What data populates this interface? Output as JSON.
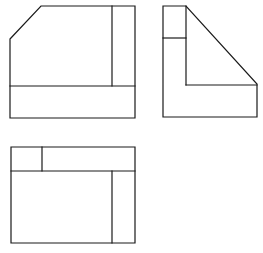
{
  "drawing": {
    "type": "orthographic-projection",
    "stroke_color": "#1a1a1a",
    "background": "#ffffff",
    "views": [
      {
        "name": "front-view",
        "outline": [
          [
            10,
            39
          ],
          [
            41,
            6
          ],
          [
            135,
            6
          ],
          [
            135,
            118
          ],
          [
            10,
            118
          ]
        ],
        "lines": [
          [
            [
              112,
              6
            ],
            [
              112,
              86
            ]
          ],
          [
            [
              10,
              86
            ],
            [
              135,
              86
            ]
          ]
        ]
      },
      {
        "name": "side-view",
        "outline": [
          [
            163,
            6
          ],
          [
            186,
            6
          ],
          [
            257,
            84
          ],
          [
            257,
            117
          ],
          [
            163,
            117
          ]
        ],
        "lines": [
          [
            [
              163,
              38
            ],
            [
              186,
              38
            ]
          ],
          [
            [
              186,
              6
            ],
            [
              186,
              85
            ]
          ],
          [
            [
              186,
              85
            ],
            [
              257,
              85
            ]
          ]
        ]
      },
      {
        "name": "top-view",
        "outline": [
          [
            11,
            147
          ],
          [
            135,
            147
          ],
          [
            135,
            243
          ],
          [
            11,
            243
          ]
        ],
        "lines": [
          [
            [
              11,
              171
            ],
            [
              135,
              171
            ]
          ],
          [
            [
              42,
              147
            ],
            [
              42,
              171
            ]
          ],
          [
            [
              112,
              171
            ],
            [
              112,
              243
            ]
          ]
        ]
      }
    ]
  }
}
